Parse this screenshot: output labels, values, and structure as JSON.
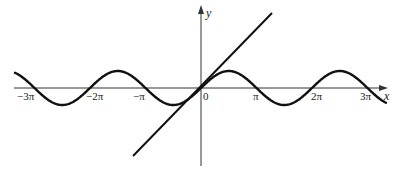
{
  "figure": {
    "axes": {
      "x_label": "x",
      "y_label": "y",
      "origin_label": "0"
    },
    "x_ticks": [
      "-3π",
      "-2π",
      "-π",
      "0",
      "π",
      "2π",
      "3π"
    ],
    "tick_labels": {
      "neg3pi": "−3π",
      "neg2pi": "−2π",
      "negpi": "−π",
      "zero": "0",
      "pi": "π",
      "twopi": "2π",
      "threepi": "3π"
    },
    "curves": [
      {
        "name": "sine-curve",
        "equation": "y = sin x"
      },
      {
        "name": "line-y-equals-x",
        "equation": "y = x"
      }
    ],
    "colors": {
      "stroke": "#111111",
      "background": "#ffffff"
    }
  }
}
